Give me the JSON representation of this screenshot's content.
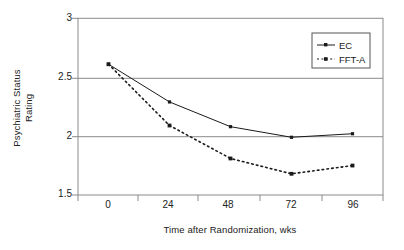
{
  "chart_data": {
    "type": "line",
    "title": "",
    "xlabel": "Time after Randomization, wks",
    "ylabel": "Psychiatric Status Rating",
    "ylabel_line1": "Psychiatric Status",
    "ylabel_line2": "Rating",
    "x": [
      0,
      24,
      48,
      72,
      96
    ],
    "categories": [
      "0",
      "24",
      "48",
      "72",
      "96"
    ],
    "xticklabels": [
      "0",
      "24",
      "48",
      "72",
      "96"
    ],
    "yticklabels": [
      "1.5",
      "2",
      "2.5",
      "3"
    ],
    "yticks": [
      1.5,
      2,
      2.5,
      3
    ],
    "ylim": [
      1.5,
      3
    ],
    "xlim": [
      -12,
      108
    ],
    "grid": "horizontal",
    "legend_position": "top-right",
    "series": [
      {
        "name": "EC",
        "values": [
          2.61,
          2.29,
          2.08,
          1.99,
          2.02
        ],
        "line_style": "solid",
        "marker": "square",
        "color": "#1a1a1a"
      },
      {
        "name": "FFT-A",
        "values": [
          2.61,
          2.09,
          1.81,
          1.68,
          1.75
        ],
        "line_style": "dotted",
        "marker": "square",
        "color": "#1a1a1a"
      }
    ],
    "legend": [
      "EC",
      "FFT-A"
    ],
    "frame_color": "#888888"
  }
}
